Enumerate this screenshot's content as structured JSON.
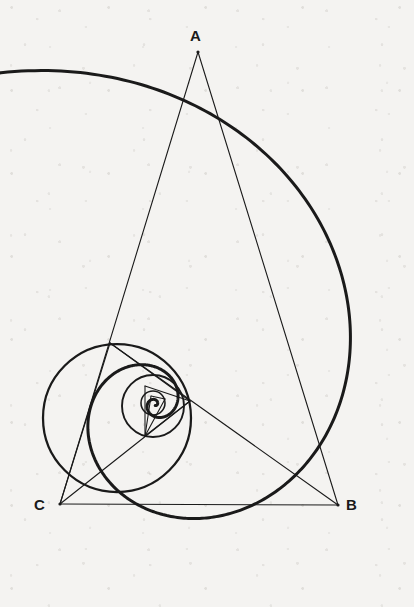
{
  "figure": {
    "background_color": "#f4f3f1",
    "stroke_color": "#1a1a1a",
    "spiral_stroke_width": 3.0,
    "circle_stroke_width": 2.6,
    "triangle_stroke_width": 1.1,
    "canvas": {
      "width": 414,
      "height": 607
    }
  },
  "labels": {
    "vertex_a": "A",
    "vertex_b": "B",
    "vertex_c": "C"
  },
  "label_positions": {
    "vertex_a": {
      "x": 190,
      "y": 28
    },
    "vertex_b": {
      "x": 346,
      "y": 497
    },
    "vertex_c": {
      "x": 34,
      "y": 497
    }
  },
  "chart_data": {
    "type": "scatter",
    "xlabel": "",
    "ylabel": "",
    "xlim": [
      0,
      414
    ],
    "ylim": [
      0,
      607
    ],
    "grid": false,
    "legend": "none",
    "note": "Geometric construction: a logarithmic spiral through a sequence of self-similar triangles ABC; each successive triangle is inscribed in a circle and scaled/rotated toward the spiral pole.",
    "spiral": {
      "pole": {
        "x": 155,
        "y": 404
      },
      "start_angle_deg": -118,
      "turns": 2.55,
      "start_radius": 372,
      "growth_per_turn": 0.118,
      "tail_point": {
        "x": 132,
        "y": 37
      },
      "rightmost_point": {
        "x": 382,
        "y": 300
      },
      "bottom_point": {
        "x": 200,
        "y": 572
      }
    },
    "levels": [
      {
        "index": 0,
        "label": "outer triangle ABC",
        "vertices": {
          "A": {
            "x": 198,
            "y": 52
          },
          "B": {
            "x": 338,
            "y": 505
          },
          "C": {
            "x": 60,
            "y": 504
          }
        },
        "circle": {
          "cx": 199,
          "cy": 300,
          "r": 183,
          "drawn": false
        }
      },
      {
        "index": 1,
        "label": "second triangle",
        "vertices": {
          "A": {
            "x": 110,
            "y": 343
          },
          "B": {
            "x": 190,
            "y": 401
          },
          "C": {
            "x": 60,
            "y": 504
          }
        },
        "circle": {
          "cx": 117,
          "cy": 418,
          "r": 74,
          "drawn": true
        }
      },
      {
        "index": 2,
        "label": "third triangle",
        "vertices": {
          "A": {
            "x": 145,
            "y": 386
          },
          "B": {
            "x": 163,
            "y": 399
          },
          "C": {
            "x": 145,
            "y": 436
          }
        },
        "circle": {
          "cx": 153,
          "cy": 406,
          "r": 31,
          "drawn": true
        }
      },
      {
        "index": 3,
        "label": "fourth triangle",
        "vertices": {
          "A": {
            "x": 151,
            "y": 396
          },
          "B": {
            "x": 158,
            "y": 401
          },
          "C": {
            "x": 150,
            "y": 412
          }
        },
        "circle": {
          "cx": 153,
          "cy": 403,
          "r": 12,
          "drawn": true
        }
      }
    ],
    "segments": [
      {
        "name": "A-to-C",
        "from": {
          "x": 198,
          "y": 52
        },
        "to": {
          "x": 60,
          "y": 504
        }
      },
      {
        "name": "A-to-B",
        "from": {
          "x": 198,
          "y": 52
        },
        "to": {
          "x": 338,
          "y": 505
        }
      },
      {
        "name": "C-to-B",
        "from": {
          "x": 60,
          "y": 504
        },
        "to": {
          "x": 338,
          "y": 505
        }
      },
      {
        "name": "L1-apex-to-B",
        "from": {
          "x": 110,
          "y": 343
        },
        "to": {
          "x": 338,
          "y": 505
        }
      },
      {
        "name": "L1-apex-to-C",
        "from": {
          "x": 110,
          "y": 343
        },
        "to": {
          "x": 60,
          "y": 504
        }
      },
      {
        "name": "L1-apex-to-L1B",
        "from": {
          "x": 110,
          "y": 343
        },
        "to": {
          "x": 190,
          "y": 401
        }
      },
      {
        "name": "L1B-to-C",
        "from": {
          "x": 190,
          "y": 401
        },
        "to": {
          "x": 60,
          "y": 504
        }
      },
      {
        "name": "L2-apex-to-L1B",
        "from": {
          "x": 145,
          "y": 386
        },
        "to": {
          "x": 190,
          "y": 401
        }
      },
      {
        "name": "L2-base-to-L1B",
        "from": {
          "x": 145,
          "y": 436
        },
        "to": {
          "x": 190,
          "y": 401
        }
      },
      {
        "name": "L2-apex-to-L2-base",
        "from": {
          "x": 145,
          "y": 386
        },
        "to": {
          "x": 145,
          "y": 436
        }
      },
      {
        "name": "L3-apex-to-L2-base",
        "from": {
          "x": 151,
          "y": 396
        },
        "to": {
          "x": 145,
          "y": 436
        }
      },
      {
        "name": "L3-b-to-L2-base",
        "from": {
          "x": 165,
          "y": 399
        },
        "to": {
          "x": 145,
          "y": 436
        }
      },
      {
        "name": "L3-apex-to-L3-b",
        "from": {
          "x": 151,
          "y": 396
        },
        "to": {
          "x": 165,
          "y": 399
        }
      }
    ]
  }
}
